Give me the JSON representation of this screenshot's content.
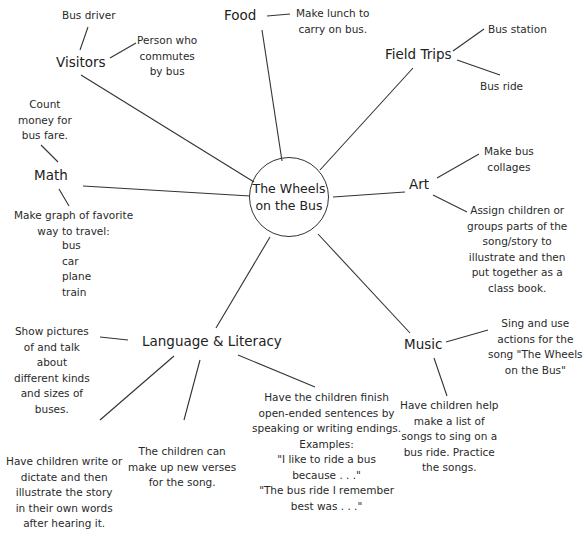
{
  "center": {
    "line1": "The Wheels",
    "line2": "on the Bus"
  },
  "topics": {
    "visitors": "Visitors",
    "food": "Food",
    "field_trips": "Field Trips",
    "math": "Math",
    "art": "Art",
    "language": "Language & Literacy",
    "music": "Music"
  },
  "notes": {
    "bus_driver": [
      "Bus driver"
    ],
    "commuter": [
      "Person who",
      "commutes",
      "by bus"
    ],
    "lunch": [
      "Make lunch to",
      "carry on bus."
    ],
    "bus_station": [
      "Bus station"
    ],
    "bus_ride": [
      "Bus ride"
    ],
    "count_money": [
      "Count",
      "money for",
      "bus fare."
    ],
    "graph": [
      "Make graph of favorite",
      "way to travel:"
    ],
    "graph_options": [
      "bus",
      "car",
      "plane",
      "train"
    ],
    "collages": [
      "Make bus",
      "collages"
    ],
    "class_book": [
      "Assign children or",
      "groups parts of the",
      "song/story to",
      "illustrate and then",
      "put together as a",
      "class book."
    ],
    "show_pictures": [
      "Show pictures",
      "of and talk",
      "about",
      "different kinds",
      "and sizes of",
      "buses."
    ],
    "sing_actions": [
      "Sing and use",
      "actions for the",
      "song \"The Wheels",
      "on the Bus\""
    ],
    "songs_list": [
      "Have children help",
      "make a list of",
      "songs to sing on a",
      "bus ride. Practice",
      "the songs."
    ],
    "write_dictate": [
      "Have children write or",
      "dictate and then",
      "illustrate the story",
      "in their own words",
      "after hearing it."
    ],
    "new_verses": [
      "The children can",
      "make up new verses",
      "for the song."
    ],
    "open_ended": [
      "Have the children finish",
      "open-ended sentences by",
      "speaking or writing endings.",
      "Examples:",
      "\"I like to ride a bus",
      "because . . .\"",
      "\"The bus ride I remember",
      "best was . . .\""
    ]
  }
}
